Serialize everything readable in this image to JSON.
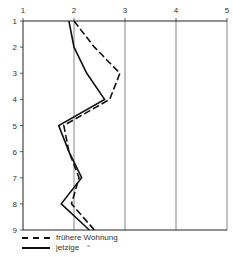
{
  "chart_data": {
    "type": "line",
    "orientation": "vertical-profile",
    "title": "",
    "xlabel": "",
    "ylabel": "",
    "x_ticks": [
      "1",
      "2",
      "3",
      "4",
      "5"
    ],
    "y_ticks": [
      "1",
      "2",
      "3",
      "4",
      "5",
      "6",
      "7",
      "8",
      "9"
    ],
    "xlim": [
      1,
      5
    ],
    "ylim": [
      1,
      9
    ],
    "grid": "vertical lines at x=2,3,4,5",
    "legend_position": "bottom-left",
    "categories": [
      1,
      2,
      3,
      4,
      5,
      6,
      7,
      8,
      9
    ],
    "series": [
      {
        "name": "frühere Wohnung",
        "style": "dashed",
        "values": [
          2.0,
          2.4,
          2.9,
          2.7,
          1.8,
          1.9,
          2.1,
          1.95,
          2.4
        ]
      },
      {
        "name": "jetzige",
        "style": "solid",
        "values": [
          1.9,
          2.0,
          2.25,
          2.6,
          1.7,
          1.9,
          2.15,
          1.75,
          2.3
        ]
      }
    ]
  },
  "legend": {
    "items": [
      {
        "label": "frühere Wohnung",
        "style": "dashed"
      },
      {
        "label": "jetzige",
        "style": "solid",
        "suffix": "“"
      }
    ]
  }
}
